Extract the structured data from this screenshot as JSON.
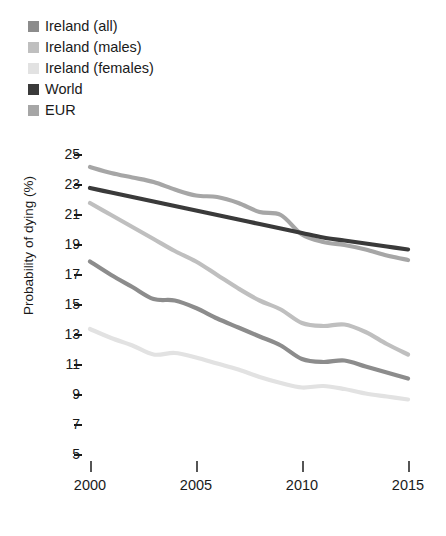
{
  "legend": {
    "items": [
      {
        "label": "Ireland (all)",
        "color": "#8c8c8c",
        "swatch": "legend-swatch-ireland-all"
      },
      {
        "label": "Ireland (males)",
        "color": "#bfbfbf",
        "swatch": "legend-swatch-ireland-males"
      },
      {
        "label": "Ireland (females)",
        "color": "#e2e2e2",
        "swatch": "legend-swatch-ireland-females"
      },
      {
        "label": "World",
        "color": "#3a3a3a",
        "swatch": "legend-swatch-world"
      },
      {
        "label": "EUR",
        "color": "#a6a6a6",
        "swatch": "legend-swatch-eur"
      }
    ]
  },
  "axes": {
    "ylabel": "Probability of dying (%)",
    "yticks": [
      "25",
      "23",
      "21",
      "19",
      "17",
      "15",
      "13",
      "11",
      "9",
      "7",
      "5"
    ],
    "xticks": [
      "2000",
      "2005",
      "2010",
      "2015"
    ]
  },
  "chart_data": {
    "type": "line",
    "title": "",
    "xlabel": "",
    "ylabel": "Probability of dying (%)",
    "xlim": [
      2000,
      2015
    ],
    "ylim": [
      5,
      25
    ],
    "grid": false,
    "legend_position": "top-left",
    "x": [
      2000,
      2001,
      2002,
      2003,
      2004,
      2005,
      2006,
      2007,
      2008,
      2009,
      2010,
      2011,
      2012,
      2013,
      2014,
      2015
    ],
    "series": [
      {
        "name": "Ireland (all)",
        "color": "#8c8c8c",
        "values": [
          17.9,
          17.0,
          16.2,
          15.4,
          15.3,
          14.8,
          14.1,
          13.5,
          12.9,
          12.3,
          11.4,
          11.2,
          11.3,
          10.9,
          10.5,
          10.1
        ]
      },
      {
        "name": "Ireland (males)",
        "color": "#bfbfbf",
        "values": [
          21.8,
          21.0,
          20.2,
          19.4,
          18.6,
          17.9,
          17.0,
          16.1,
          15.3,
          14.7,
          13.8,
          13.6,
          13.7,
          13.2,
          12.4,
          11.7
        ]
      },
      {
        "name": "Ireland (females)",
        "color": "#e2e2e2",
        "values": [
          13.4,
          12.8,
          12.3,
          11.7,
          11.8,
          11.5,
          11.1,
          10.7,
          10.2,
          9.8,
          9.5,
          9.6,
          9.4,
          9.1,
          8.9,
          8.7
        ]
      },
      {
        "name": "World",
        "color": "#3a3a3a",
        "values": [
          22.8,
          22.5,
          22.2,
          21.9,
          21.6,
          21.3,
          21.0,
          20.7,
          20.4,
          20.1,
          19.8,
          19.5,
          19.3,
          19.1,
          18.9,
          18.7
        ]
      },
      {
        "name": "EUR",
        "color": "#a6a6a6",
        "values": [
          24.2,
          23.8,
          23.5,
          23.2,
          22.7,
          22.3,
          22.2,
          21.8,
          21.2,
          21.0,
          19.7,
          19.2,
          19.0,
          18.7,
          18.3,
          18.0
        ]
      }
    ]
  }
}
